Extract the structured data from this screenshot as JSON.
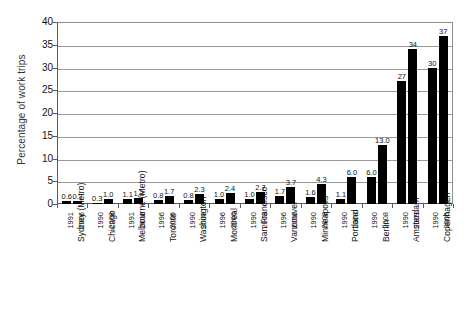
{
  "chart_data": {
    "type": "bar",
    "title": "",
    "xlabel": "",
    "ylabel": "Percentage of work trips",
    "ylim": [
      0,
      40
    ],
    "yticks": [
      0,
      5,
      10,
      15,
      20,
      25,
      30,
      35,
      40
    ],
    "grid": true,
    "legend": false,
    "bar_color": "#000000",
    "groups": [
      {
        "city": "Sydney (Metro)",
        "years": [
          "1991",
          "2006"
        ],
        "values": [
          0.6,
          0.7
        ],
        "labels": [
          "0.6",
          "0.7"
        ]
      },
      {
        "city": "Chicago",
        "years": [
          "1990",
          "2008"
        ],
        "values": [
          0.3,
          1.0
        ],
        "labels": [
          "0.3",
          "1.0"
        ]
      },
      {
        "city": "Melbourne (Metro)",
        "years": [
          "1991",
          "2006"
        ],
        "values": [
          1.1,
          1.3
        ],
        "labels": [
          "1.1",
          "1.3"
        ]
      },
      {
        "city": "Toronto",
        "years": [
          "1996",
          "2006"
        ],
        "values": [
          0.8,
          1.7
        ],
        "labels": [
          "0.8",
          "1.7"
        ]
      },
      {
        "city": "Washington",
        "years": [
          "1990",
          "2008"
        ],
        "values": [
          0.8,
          2.3
        ],
        "labels": [
          "0.8",
          "2.3"
        ]
      },
      {
        "city": "Montreal",
        "years": [
          "1996",
          "2006"
        ],
        "values": [
          1.0,
          2.4
        ],
        "labels": [
          "1.0",
          "2.4"
        ]
      },
      {
        "city": "San Francisco",
        "years": [
          "1990",
          "2008"
        ],
        "values": [
          1.0,
          2.7
        ],
        "labels": [
          "1.0",
          "2.7"
        ]
      },
      {
        "city": "Vancouver",
        "years": [
          "1996",
          "2006"
        ],
        "values": [
          1.7,
          3.7
        ],
        "labels": [
          "1.7",
          "3.7"
        ]
      },
      {
        "city": "Minneapolis",
        "years": [
          "1990",
          "2008"
        ],
        "values": [
          1.6,
          4.3
        ],
        "labels": [
          "1.6",
          "4.3"
        ]
      },
      {
        "city": "Portland",
        "years": [
          "1990",
          "2008"
        ],
        "values": [
          1.1,
          6.0
        ],
        "labels": [
          "1.1",
          "6.0"
        ]
      },
      {
        "city": "Berlin",
        "years": [
          "1990",
          "2008"
        ],
        "values": [
          6.0,
          13.0
        ],
        "labels": [
          "6.0",
          "13.0"
        ]
      },
      {
        "city": "Amsterdam",
        "years": [
          "1990",
          "2009"
        ],
        "values": [
          27,
          34
        ],
        "labels": [
          "27",
          "34"
        ]
      },
      {
        "city": "Copenhagen",
        "years": [
          "1990",
          "2005"
        ],
        "values": [
          30,
          37
        ],
        "labels": [
          "30",
          "37"
        ]
      }
    ]
  }
}
